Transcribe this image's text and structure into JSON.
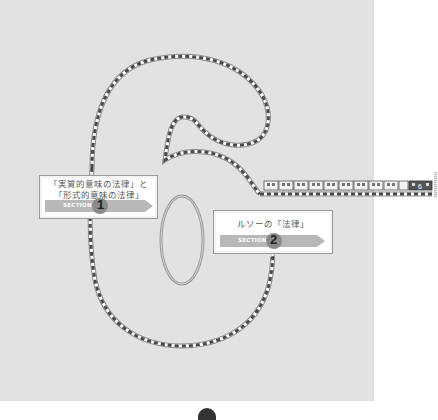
{
  "chapter": {
    "number": "6",
    "decoration": "train-track-digit-six"
  },
  "sections": [
    {
      "title": "「実質的意味の法律」と\n「形式的意味の法律」",
      "label": "SECTION",
      "number": "1"
    },
    {
      "title": "ルソーの「法律」",
      "label": "SECTION",
      "number": "2"
    }
  ],
  "train": {
    "car_count": 11,
    "locomotive_label": "6"
  },
  "colors": {
    "page_background": "#e2e2e2",
    "track_dark": "#555555",
    "track_light": "#ffffff",
    "ribbon": "#b8b8b8"
  }
}
